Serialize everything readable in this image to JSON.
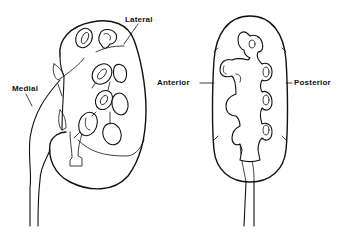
{
  "figure": {
    "colors": {
      "ink": "#111111",
      "background": "#ffffff"
    },
    "left_view": {
      "name": "oblique-kidney-view",
      "labels": {
        "lateral": "Lateral",
        "medial": "Medial"
      }
    },
    "right_view": {
      "name": "frontal-kidney-view",
      "labels": {
        "anterior": "Anterior",
        "posterior": "Posterior"
      }
    }
  }
}
